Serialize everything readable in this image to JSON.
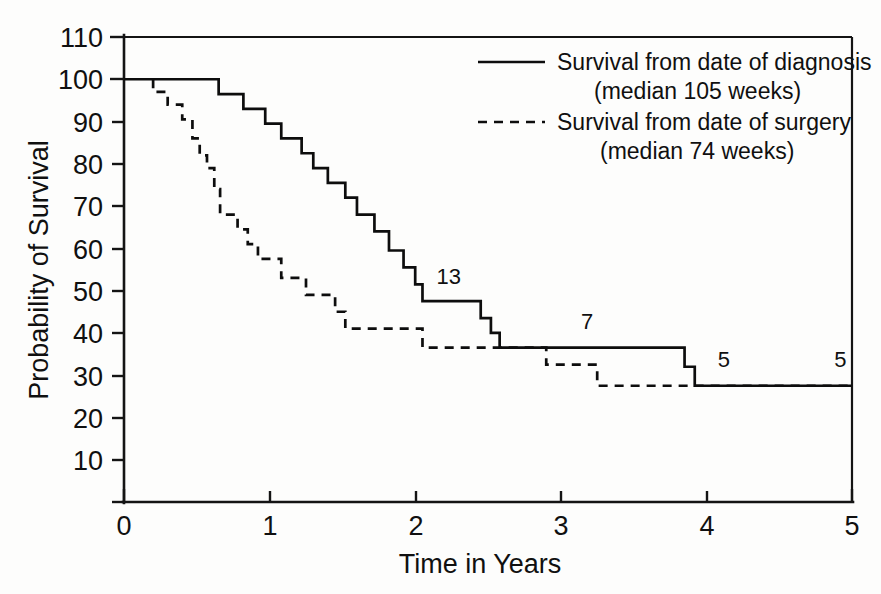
{
  "chart_data": {
    "type": "line",
    "title": "",
    "subtitle": "",
    "xlabel": "Time in Years",
    "ylabel": "Probability of Survival",
    "xlim": [
      0,
      5
    ],
    "ylim": [
      0,
      110
    ],
    "xticks": [
      0,
      1,
      2,
      3,
      4,
      5
    ],
    "xtick_labels": [
      "0",
      "1",
      "2",
      "3",
      "4",
      "5"
    ],
    "yticks": [
      0,
      10,
      20,
      30,
      40,
      50,
      60,
      70,
      80,
      90,
      100,
      110
    ],
    "ytick_labels": [
      "",
      "10",
      "20",
      "30",
      "40",
      "50",
      "60",
      "70",
      "80",
      "90",
      "100",
      "110"
    ],
    "grid": false,
    "legend_position": "top-right",
    "series": [
      {
        "name": "Survival from date of diagnosis",
        "legend_label_line1": "Survival from date of diagnosis",
        "legend_label_line2": "(median 105 weeks)",
        "median_weeks": 105,
        "style": "solid",
        "color": "#0d0d0d",
        "points": [
          [
            0.0,
            100
          ],
          [
            0.65,
            100
          ],
          [
            0.65,
            96.5
          ],
          [
            0.82,
            96.5
          ],
          [
            0.82,
            93
          ],
          [
            0.97,
            93
          ],
          [
            0.97,
            89.5
          ],
          [
            1.08,
            89.5
          ],
          [
            1.08,
            86
          ],
          [
            1.22,
            86
          ],
          [
            1.22,
            82.5
          ],
          [
            1.3,
            82.5
          ],
          [
            1.3,
            79
          ],
          [
            1.4,
            79
          ],
          [
            1.4,
            75.5
          ],
          [
            1.52,
            75.5
          ],
          [
            1.52,
            72
          ],
          [
            1.6,
            72
          ],
          [
            1.6,
            68
          ],
          [
            1.72,
            68
          ],
          [
            1.72,
            64
          ],
          [
            1.82,
            64
          ],
          [
            1.82,
            59.5
          ],
          [
            1.92,
            59.5
          ],
          [
            1.92,
            55.5
          ],
          [
            2.0,
            55.5
          ],
          [
            2.0,
            51.5
          ],
          [
            2.05,
            51.5
          ],
          [
            2.05,
            47.5
          ],
          [
            2.45,
            47.5
          ],
          [
            2.45,
            43.5
          ],
          [
            2.52,
            43.5
          ],
          [
            2.52,
            40
          ],
          [
            2.58,
            40
          ],
          [
            2.58,
            36.5
          ],
          [
            3.85,
            36.5
          ],
          [
            3.85,
            32
          ],
          [
            3.92,
            32
          ],
          [
            3.92,
            27.5
          ],
          [
            5.0,
            27.5
          ]
        ]
      },
      {
        "name": "Survival from date of surgery",
        "legend_label_line1": "Survival from date of surgery",
        "legend_label_line2": "(median 74 weeks)",
        "median_weeks": 74,
        "style": "dashed",
        "color": "#0d0d0d",
        "points": [
          [
            0.2,
            100
          ],
          [
            0.2,
            97
          ],
          [
            0.3,
            97
          ],
          [
            0.3,
            94
          ],
          [
            0.4,
            94
          ],
          [
            0.4,
            90.5
          ],
          [
            0.47,
            90.5
          ],
          [
            0.47,
            86
          ],
          [
            0.52,
            86
          ],
          [
            0.52,
            82
          ],
          [
            0.57,
            82
          ],
          [
            0.57,
            79
          ],
          [
            0.62,
            79
          ],
          [
            0.62,
            74
          ],
          [
            0.66,
            74
          ],
          [
            0.66,
            68
          ],
          [
            0.78,
            68
          ],
          [
            0.78,
            64.5
          ],
          [
            0.85,
            64.5
          ],
          [
            0.85,
            61
          ],
          [
            0.92,
            61
          ],
          [
            0.92,
            57.5
          ],
          [
            1.08,
            57.5
          ],
          [
            1.08,
            53
          ],
          [
            1.25,
            53
          ],
          [
            1.25,
            49
          ],
          [
            1.45,
            49
          ],
          [
            1.45,
            45
          ],
          [
            1.52,
            45
          ],
          [
            1.52,
            41
          ],
          [
            2.05,
            41
          ],
          [
            2.05,
            36.5
          ],
          [
            2.9,
            36.5
          ],
          [
            2.9,
            32.5
          ],
          [
            3.25,
            32.5
          ],
          [
            3.25,
            27.5
          ],
          [
            5.0,
            27.5
          ]
        ]
      }
    ],
    "annotations": [
      {
        "label": "13",
        "x": 2.23,
        "y": 51.5
      },
      {
        "label": "7",
        "x": 3.18,
        "y": 41.0
      },
      {
        "label": "5",
        "x": 4.12,
        "y": 32.0
      },
      {
        "label": "5",
        "x": 4.92,
        "y": 32.0
      }
    ]
  },
  "legend": {
    "entries": [
      {
        "style": "solid",
        "line1": "Survival from date of diagnosis",
        "line2": "(median 105 weeks)"
      },
      {
        "style": "dashed",
        "line1": "Survival from date of surgery",
        "line2": "(median 74 weeks)"
      }
    ]
  },
  "axes": {
    "x_title": "Time in Years",
    "y_title": "Probability of Survival"
  }
}
